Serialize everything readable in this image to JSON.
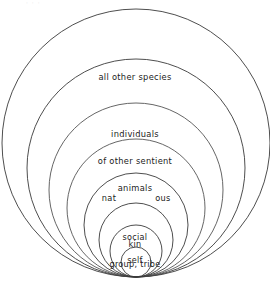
{
  "figure": {
    "kind": "nested-circles-diagram",
    "background_color": "#ffffff",
    "stroke_color": "#3a3a3a",
    "text_color": "#1b1b1b",
    "tangent_point": {
      "x": 135,
      "y": 277
    },
    "faint_top_caption": "· · ·",
    "rings": [
      {
        "id": "ring-all-other-species",
        "name": "all other species",
        "label": "all other species",
        "order": 1,
        "center": {
          "x": 136,
          "y": 143
        },
        "radius": 134
      },
      {
        "id": "ring-sentient-animals",
        "name": "individuals of other sentient animals",
        "label": "individuals\nof other sentient\nanimals",
        "order": 2,
        "center": {
          "x": 136,
          "y": 168
        },
        "radius": 109
      },
      {
        "id": "ring-unlabeled-outer-mid",
        "name": "unlabeled intermediate ring",
        "label": "",
        "order": 3,
        "center": {
          "x": 136,
          "y": 190
        },
        "radius": 87
      },
      {
        "id": "ring-unlabeled-mid",
        "name": "unlabeled intermediate ring",
        "label": "",
        "order": 4,
        "center": {
          "x": 136,
          "y": 208
        },
        "radius": 69
      },
      {
        "id": "ring-nation",
        "name": "nation",
        "label_left": "nat",
        "label_right": "ous",
        "order": 5,
        "center": {
          "x": 136,
          "y": 225
        },
        "radius": 52
      },
      {
        "id": "ring-social-group-tribe",
        "name": "social group, tribe",
        "label": "social\ngroup, tribe",
        "order": 6,
        "center": {
          "x": 136,
          "y": 240
        },
        "radius": 37
      },
      {
        "id": "ring-kin",
        "name": "kin",
        "label": "kin",
        "order": 7,
        "center": {
          "x": 136,
          "y": 251
        },
        "radius": 26
      },
      {
        "id": "ring-self",
        "name": "self",
        "label": "self",
        "order": 8,
        "center": {
          "x": 136,
          "y": 262
        },
        "radius": 15
      }
    ]
  },
  "labels": {
    "all_other_species": "all other species",
    "sentient_animals_line1": "individuals",
    "sentient_animals_line2": "of other sentient",
    "sentient_animals_line3": "animals",
    "nation_left": "nat",
    "nation_right": "ous",
    "social_group_line1": "social",
    "social_group_line2": "group, tribe",
    "kin": "kin",
    "self": "self"
  }
}
